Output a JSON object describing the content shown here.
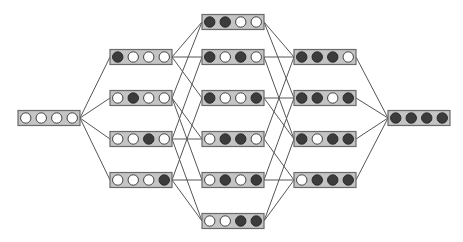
{
  "diagram": {
    "type": "boolean-lattice-hasse-diagram",
    "bits_per_node": 4,
    "colors": {
      "background": "#ffffff",
      "box_fill": "#c4c4c4",
      "box_border": "#6a6a6a",
      "bit_on": "#3c3c3c",
      "bit_off": "#ffffff",
      "edge": "#555555"
    },
    "levels": [
      {
        "level": 0,
        "x": 18,
        "nodes": [
          {
            "id": "0000",
            "bits": [
              0,
              0,
              0,
              0
            ],
            "cy": 118
          }
        ]
      },
      {
        "level": 1,
        "x": 110,
        "nodes": [
          {
            "id": "1000",
            "bits": [
              1,
              0,
              0,
              0
            ],
            "cy": 57
          },
          {
            "id": "0100",
            "bits": [
              0,
              1,
              0,
              0
            ],
            "cy": 98
          },
          {
            "id": "0010",
            "bits": [
              0,
              0,
              1,
              0
            ],
            "cy": 139
          },
          {
            "id": "0001",
            "bits": [
              0,
              0,
              0,
              1
            ],
            "cy": 180
          }
        ]
      },
      {
        "level": 2,
        "x": 202,
        "nodes": [
          {
            "id": "1100",
            "bits": [
              1,
              1,
              0,
              0
            ],
            "cy": 22
          },
          {
            "id": "1010",
            "bits": [
              1,
              0,
              1,
              0
            ],
            "cy": 57
          },
          {
            "id": "1001",
            "bits": [
              1,
              0,
              0,
              1
            ],
            "cy": 98
          },
          {
            "id": "0110",
            "bits": [
              0,
              1,
              1,
              0
            ],
            "cy": 139
          },
          {
            "id": "0101",
            "bits": [
              0,
              1,
              0,
              1
            ],
            "cy": 180
          },
          {
            "id": "0011",
            "bits": [
              0,
              0,
              1,
              1
            ],
            "cy": 221
          }
        ]
      },
      {
        "level": 3,
        "x": 294,
        "nodes": [
          {
            "id": "1110",
            "bits": [
              1,
              1,
              1,
              0
            ],
            "cy": 57
          },
          {
            "id": "1101",
            "bits": [
              1,
              1,
              0,
              1
            ],
            "cy": 98
          },
          {
            "id": "1011",
            "bits": [
              1,
              0,
              1,
              1
            ],
            "cy": 139
          },
          {
            "id": "0111",
            "bits": [
              0,
              1,
              1,
              1
            ],
            "cy": 180
          }
        ]
      },
      {
        "level": 4,
        "x": 388,
        "nodes": [
          {
            "id": "1111",
            "bits": [
              1,
              1,
              1,
              1
            ],
            "cy": 118
          }
        ]
      }
    ],
    "box": {
      "width": 62,
      "height": 15
    }
  }
}
